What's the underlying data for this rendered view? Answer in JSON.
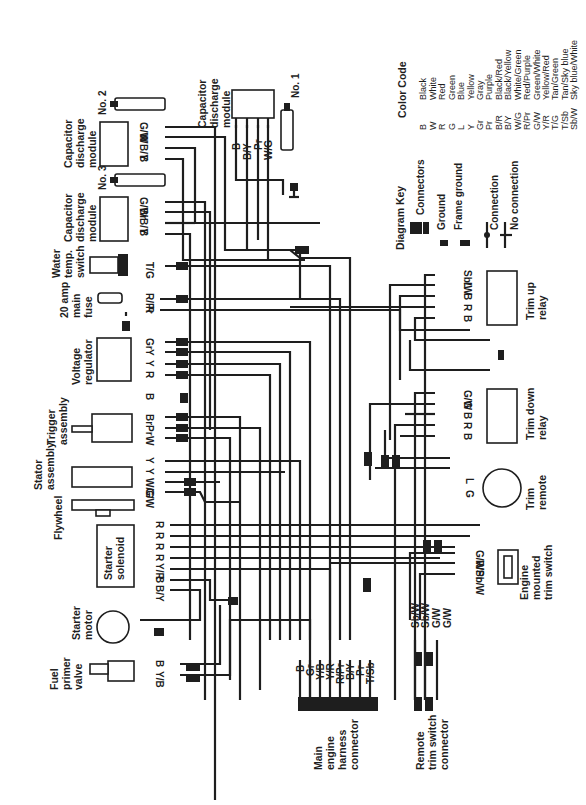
{
  "diagram": {
    "orientation": "rotated-90-ccw",
    "components": {
      "cdm_no1": {
        "title": [
          "Capacitor",
          "discharge",
          "module"
        ],
        "plug": "No. 1",
        "wires": [
          "B",
          "B/Y",
          "Pr",
          "W/G"
        ]
      },
      "cdm_no2": {
        "title": [
          "Capacitor",
          "discharge",
          "module"
        ],
        "plug": "No. 2",
        "wires": [
          "G/W",
          "W",
          "B/Y",
          "B"
        ]
      },
      "cdm_no3": {
        "title": [
          "Capacitor",
          "discharge",
          "module"
        ],
        "plug": "No. 3",
        "wires": [
          "G/W",
          "Br",
          "B/Y",
          "B"
        ]
      },
      "water_temp_switch": {
        "title": [
          "Water",
          "temp.",
          "switch"
        ],
        "wires": [
          "T/G"
        ]
      },
      "main_fuse": {
        "title": [
          "20 amp",
          "main",
          "fuse"
        ],
        "wires": [
          "R/Pr",
          "R"
        ]
      },
      "voltage_regulator": {
        "title": [
          "Voltage",
          "regulator"
        ],
        "wires": [
          "Gr",
          "Y",
          "Y",
          "R"
        ]
      },
      "trigger_assembly": {
        "title": [
          "Trigger",
          "assembly"
        ],
        "wires": [
          "B",
          "Br",
          "Pr",
          "W"
        ]
      },
      "stator_assembly": {
        "title": [
          "Stator",
          "assembly"
        ],
        "wires": [
          "Y",
          "Y",
          "W/G",
          "G/W"
        ]
      },
      "flywheel": {
        "title": [
          "Flywheel"
        ]
      },
      "starter_solenoid": {
        "title": [
          "Starter",
          "solenoid"
        ],
        "wires": [
          "R",
          "R",
          "R",
          "R",
          "Y/R",
          "B",
          "B/Y"
        ]
      },
      "starter_motor": {
        "title": [
          "Starter",
          "motor"
        ]
      },
      "fuel_primer_valve": {
        "title": [
          "Fuel",
          "primer",
          "valve"
        ],
        "wires": [
          "B",
          "Y/B"
        ]
      },
      "main_harness_connector": {
        "title": [
          "Main",
          "engine",
          "harness",
          "connector"
        ],
        "wires": [
          "B",
          "Gr",
          "Y/B",
          "Y/R",
          "R/Pr",
          "B/Y",
          "Pr",
          "T/Sb"
        ]
      },
      "remote_trim_connector": {
        "title": [
          "Remote",
          "trim switch",
          "connector"
        ],
        "wires": [
          "Sb/W",
          "Sb/W",
          "G/W",
          "G/W"
        ]
      },
      "engine_trim_switch": {
        "title": [
          "Engine",
          "mounted",
          "trim switch"
        ],
        "wires": [
          "G/W",
          "R/Pr",
          "Sb/W"
        ]
      },
      "trim_remote": {
        "title": [
          "Trim",
          "remote"
        ],
        "wires": [
          "L",
          "G"
        ]
      },
      "trim_down_relay": {
        "title": [
          "Trim down",
          "relay"
        ],
        "wires": [
          "G/W",
          "G",
          "B",
          "R",
          "B"
        ]
      },
      "trim_up_relay": {
        "title": [
          "Trim up",
          "relay"
        ],
        "wires": [
          "Sb/W",
          "L",
          "B",
          "R",
          "B"
        ]
      }
    },
    "diagram_key": {
      "title": "Diagram Key",
      "items": [
        "Connectors",
        "Ground",
        "Frame ground",
        "Connection",
        "No connection"
      ]
    },
    "color_code": {
      "title": "Color Code",
      "entries": [
        {
          "code": "B",
          "name": "Black"
        },
        {
          "code": "W",
          "name": "White"
        },
        {
          "code": "R",
          "name": "Red"
        },
        {
          "code": "G",
          "name": "Green"
        },
        {
          "code": "L",
          "name": "Blue"
        },
        {
          "code": "Y",
          "name": "Yellow"
        },
        {
          "code": "Gr",
          "name": "Gray"
        },
        {
          "code": "Pr",
          "name": "Purple"
        },
        {
          "code": "B/R",
          "name": "Black/Red"
        },
        {
          "code": "B/Y",
          "name": "Black/Yellow"
        },
        {
          "code": "W/G",
          "name": "White/Green"
        },
        {
          "code": "R/Pr",
          "name": "Red/Purple"
        },
        {
          "code": "G/W",
          "name": "Green/White"
        },
        {
          "code": "Y/R",
          "name": "Yellow/Red"
        },
        {
          "code": "T/G",
          "name": "Tan/Green"
        },
        {
          "code": "T/Sb",
          "name": "Tan/Sky blue"
        },
        {
          "code": "Sb/W",
          "name": "Sky blue/White"
        }
      ]
    }
  }
}
